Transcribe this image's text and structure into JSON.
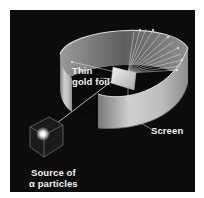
{
  "diagram": {
    "type": "rutherford-gold-foil-experiment",
    "labels": {
      "foil_line1": "Thin",
      "foil_line2": "gold foil",
      "screen": "Screen",
      "source_line1": "Source of",
      "source_line2": "α particles"
    },
    "components": [
      "alpha-particle-source",
      "alpha-beam",
      "thin-gold-foil",
      "circular-detection-screen",
      "deflected-particle-paths"
    ],
    "colors": {
      "background_panel": "#0c0c0c",
      "page_background": "#ffffff",
      "screen_light": "#d8d8d8",
      "screen_dark": "#8a8a8a",
      "foil": "#e6e6e6",
      "paths": "#e8e8e8",
      "label_text": "#f2f2f2"
    }
  }
}
